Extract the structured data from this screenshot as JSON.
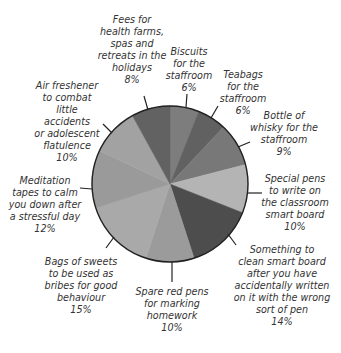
{
  "chart_data": {
    "type": "pie",
    "title": "",
    "start_angle_deg": 0,
    "direction": "clockwise",
    "center": [
      170,
      184
    ],
    "radius": 78,
    "slices": [
      {
        "label": "Biscuits for the staffroom",
        "value": 6,
        "color": "#7d7d7d"
      },
      {
        "label": "Teabags for the staffroom",
        "value": 6,
        "color": "#616161"
      },
      {
        "label": "Bottle of whisky for the staffroom",
        "value": 9,
        "color": "#787878"
      },
      {
        "label": "Special pens to write on the classroom smart board",
        "value": 10,
        "color": "#b4b4b4"
      },
      {
        "label": "Something to clean smart board after you have accidentally written on it with the wrong sort of pen",
        "value": 14,
        "color": "#4d4d4d"
      },
      {
        "label": "Spare red pens for marking homework",
        "value": 10,
        "color": "#9b9b9b"
      },
      {
        "label": "Bags of sweets to be used as bribes for good behaviour",
        "value": 15,
        "color": "#a9a9a9"
      },
      {
        "label": "Meditation tapes to calm you down after a stressful day",
        "value": 12,
        "color": "#9a9a9a"
      },
      {
        "label": "Air freshener to combat little accidents or adolescent flatulence",
        "value": 10,
        "color": "#a2a2a2"
      },
      {
        "label": "Fees for health farms, spas and retreats in the holidays",
        "value": 8,
        "color": "#626262"
      }
    ]
  },
  "labels": [
    {
      "text": "Biscuits\nfor the\nstaffroom\n6%",
      "x": 157,
      "y": 46,
      "w": 64,
      "leader": [
        186,
        107,
        187,
        94
      ]
    },
    {
      "text": "Teabags\nfor the\nstaffroom\n6%",
      "x": 214,
      "y": 69,
      "w": 58,
      "leader": [
        211,
        118,
        218,
        106
      ]
    },
    {
      "text": "Bottle of\nwhisky for the\nstaffroom\n9%",
      "x": 248,
      "y": 110,
      "w": 72,
      "leader": [
        238,
        147,
        250,
        142
      ]
    },
    {
      "text": "Special pens\nto write on\nthe classroom\nsmart board\n10%",
      "x": 255,
      "y": 173,
      "w": 80,
      "leader": [
        247,
        193,
        262,
        193
      ]
    },
    {
      "text": "Something to\nclean smart board\nafter you have\naccidentally written\non it with the wrong\nsort of pen\n14%",
      "x": 226,
      "y": 244,
      "w": 112,
      "leader": [
        228,
        234,
        236,
        245
      ]
    },
    {
      "text": "Spare red pens\nfor marking\nhomework\n10%",
      "x": 132,
      "y": 286,
      "w": 80,
      "leader": [
        172,
        262,
        172,
        282
      ]
    },
    {
      "text": "Bags of sweets\nto be used as\nbribes for good\nbehaviour\n15%",
      "x": 38,
      "y": 256,
      "w": 86,
      "leader": [
        114,
        237,
        106,
        248
      ]
    },
    {
      "text": "Meditation\ntapes to calm\nyou down after\na stressful day\n12%",
      "x": 4,
      "y": 175,
      "w": 82,
      "leader": [
        92,
        189,
        80,
        188
      ]
    },
    {
      "text": "Air freshener\nto combat\nlittle accidents\nor adolescent\nflatulence\n10%",
      "x": 32,
      "y": 80,
      "w": 70,
      "leader": [
        112,
        133,
        103,
        124
      ]
    },
    {
      "text": "Fees for\nhealth farms,\nspas and\nretreats in the\nholidays\n8%",
      "x": 96,
      "y": 14,
      "w": 72,
      "leader": [
        148,
        110,
        144,
        96
      ]
    }
  ]
}
